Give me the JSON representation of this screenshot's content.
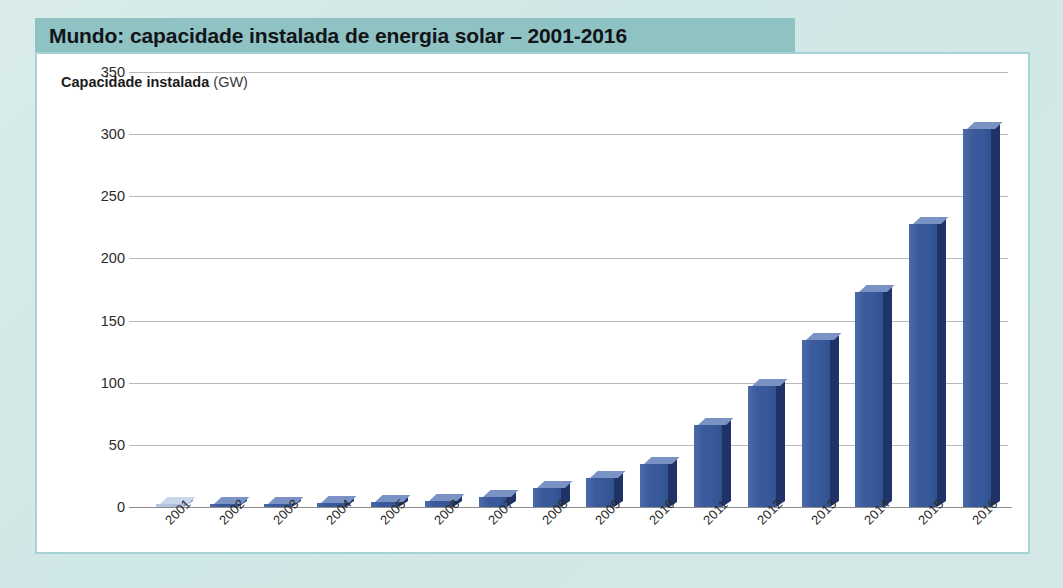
{
  "title": {
    "text": "Mundo: capacidade instalada de energia solar – 2001-2016"
  },
  "axis_title": {
    "main": "Capacidade instalada ",
    "unit": "(GW)"
  },
  "colors": {
    "title_bar": "#8fc2c3",
    "page_background": "#cfe7e6",
    "panel_background": "#ffffff",
    "panel_border": "#a8d3d4",
    "bar_front": "#3a5a9c",
    "bar_side": "#1f3368",
    "bar_top": "#7b93c4",
    "gridline": "#b9b9b9"
  },
  "chart_data": {
    "type": "bar",
    "title": "Mundo: capacidade instalada de energia solar – 2001-2016",
    "xlabel": "",
    "ylabel": "Capacidade instalada (GW)",
    "ylim": [
      0,
      350
    ],
    "yticks": [
      0,
      50,
      100,
      150,
      200,
      250,
      300,
      350
    ],
    "ytick_labels": [
      "0",
      "50",
      "100",
      "150",
      "200",
      "250",
      "300",
      "350"
    ],
    "grid": true,
    "legend": false,
    "categories": [
      "2001",
      "2002",
      "2003",
      "2004",
      "2005",
      "2006",
      "2007",
      "2008",
      "2009",
      "2010",
      "2011",
      "2012",
      "2013",
      "2014",
      "2015",
      "2016"
    ],
    "values": [
      1,
      2,
      2,
      3,
      4,
      5,
      8,
      15,
      23,
      35,
      66,
      97,
      134,
      173,
      228,
      304
    ]
  }
}
